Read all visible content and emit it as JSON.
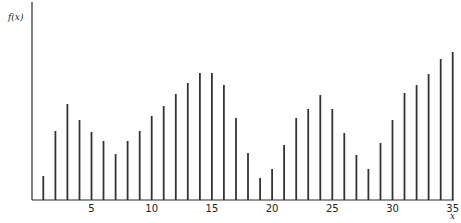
{
  "chart_data": {
    "type": "bar",
    "style": "stem",
    "title": "",
    "xlabel": "x",
    "ylabel": "f(x)",
    "x": [
      1,
      2,
      3,
      4,
      5,
      6,
      7,
      8,
      9,
      10,
      11,
      12,
      13,
      14,
      15,
      16,
      17,
      18,
      19,
      20,
      21,
      22,
      23,
      24,
      25,
      26,
      27,
      28,
      29,
      30,
      31,
      32,
      33,
      34,
      35
    ],
    "values": [
      24,
      69,
      96,
      80,
      68,
      59,
      46,
      59,
      69,
      84,
      94,
      106,
      117,
      127,
      127,
      115,
      82,
      47,
      22,
      31,
      55,
      82,
      91,
      105,
      91,
      67,
      45,
      31,
      57,
      80,
      107,
      115,
      126,
      141,
      148
    ],
    "value_units": "relative pixel height (no y-axis scale shown)",
    "xticks": [
      5,
      10,
      15,
      20,
      25,
      30,
      35
    ],
    "xtick_labels": [
      "5",
      "10",
      "15",
      "20",
      "25",
      "30",
      "35"
    ],
    "xlim": [
      0,
      35
    ],
    "ylim": [
      0,
      200
    ],
    "grid": false,
    "legend": null,
    "colors": {
      "stem": "#333333",
      "axis": "#2a2a2a",
      "text": "#222222"
    }
  },
  "labels": {
    "y_axis": "f(x)",
    "x_axis": "x"
  }
}
